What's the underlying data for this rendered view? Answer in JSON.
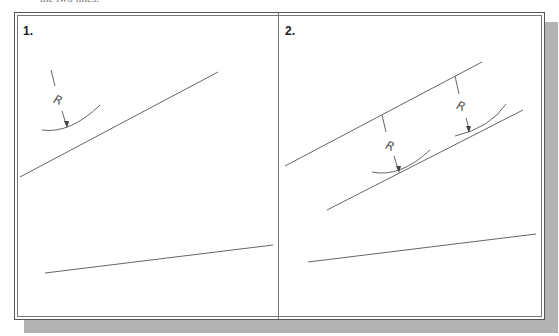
{
  "caption_fragment": "the two lines.",
  "panels": [
    {
      "label": "1.",
      "radius_label": "R",
      "lines": [
        {
          "x1": 20,
          "y1": 177,
          "x2": 218,
          "y2": 72
        },
        {
          "x1": 45,
          "y1": 273,
          "x2": 273,
          "y2": 245
        }
      ]
    },
    {
      "label": "2.",
      "radius_label_1": "R",
      "radius_label_2": "R",
      "lines": [
        {
          "x1": 285,
          "y1": 166,
          "x2": 482,
          "y2": 62
        },
        {
          "x1": 327,
          "y1": 210,
          "x2": 523,
          "y2": 110
        },
        {
          "x1": 308,
          "y1": 262,
          "x2": 536,
          "y2": 234
        }
      ]
    }
  ],
  "colors": {
    "line": "#666666",
    "frame": "#555555",
    "shadow": "#b3b3b3"
  }
}
